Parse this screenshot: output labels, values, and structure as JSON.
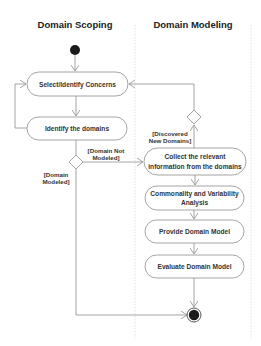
{
  "diagram": {
    "type": "UML activity diagram with swimlanes",
    "lanes": [
      {
        "id": "scoping",
        "title": "Domain Scoping"
      },
      {
        "id": "modeling",
        "title": "Domain Modeling"
      }
    ],
    "nodes": {
      "initial": {
        "kind": "initial"
      },
      "select_concerns": {
        "kind": "action",
        "label": "Select/Identify Concerns",
        "lane": "scoping"
      },
      "identify_domains": {
        "kind": "action",
        "label": "Identify the domains",
        "lane": "scoping"
      },
      "decision_modeled": {
        "kind": "decision",
        "lane": "scoping"
      },
      "collect_info": {
        "kind": "action",
        "label_line1": "Collect the relevant",
        "label_line2": "information from the domains",
        "lane": "modeling"
      },
      "decision_discovered": {
        "kind": "decision",
        "lane": "modeling"
      },
      "cva": {
        "kind": "action",
        "label_line1": "Commonality and Variability",
        "label_line2": "Analysis",
        "lane": "modeling"
      },
      "provide_model": {
        "kind": "action",
        "label": "Provide Domain Model",
        "lane": "modeling"
      },
      "evaluate_model": {
        "kind": "action",
        "label": "Evaluate Domain Model",
        "lane": "modeling"
      },
      "final": {
        "kind": "final"
      }
    },
    "guards": {
      "not_modeled_line1": "[Domain Not",
      "not_modeled_line2": "Modeled]",
      "modeled_line1": "[Domain",
      "modeled_line2": "Modeled]",
      "discovered_line1": "[Discovered",
      "discovered_line2": "New Domains]"
    },
    "edges": [
      {
        "from": "initial",
        "to": "select_concerns"
      },
      {
        "from": "select_concerns",
        "to": "identify_domains"
      },
      {
        "from": "identify_domains",
        "to": "select_concerns",
        "note": "loop back"
      },
      {
        "from": "identify_domains",
        "to": "decision_modeled"
      },
      {
        "from": "decision_modeled",
        "to": "collect_info",
        "guard": "[Domain Not Modeled]"
      },
      {
        "from": "decision_modeled",
        "to": "final",
        "guard": "[Domain Modeled]"
      },
      {
        "from": "collect_info",
        "to": "decision_discovered"
      },
      {
        "from": "decision_discovered",
        "to": "select_concerns",
        "guard": "[Discovered New Domains]"
      },
      {
        "from": "collect_info",
        "to": "cva"
      },
      {
        "from": "cva",
        "to": "provide_model"
      },
      {
        "from": "provide_model",
        "to": "evaluate_model"
      },
      {
        "from": "evaluate_model",
        "to": "final"
      }
    ],
    "colors": {
      "line": "#9a9a9a",
      "node_fill": "#1a1a1a",
      "text": "#333333"
    }
  }
}
